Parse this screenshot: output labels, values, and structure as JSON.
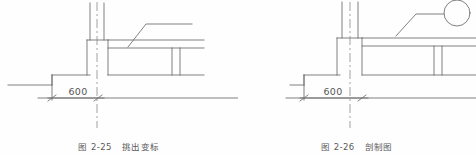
{
  "page": {
    "background_color": "#fefefe",
    "line_color": "#6b6b6b",
    "text_color": "#5a5a5a",
    "width": 476,
    "height": 154
  },
  "figures": [
    {
      "id": "figure-left",
      "caption_number": "图 2-25",
      "caption_title": "挑出变标",
      "dimension_label": "600",
      "detail_bubble": false,
      "elements": [
        "ground-line",
        "step-profile",
        "column",
        "column-centerline",
        "beam",
        "beam-rib",
        "leader-line",
        "dimension-line"
      ]
    },
    {
      "id": "figure-right",
      "caption_number": "图 2-26",
      "caption_title": "剖制图",
      "dimension_label": "600",
      "detail_bubble": true,
      "elements": [
        "ground-line",
        "step-profile",
        "column",
        "column-centerline",
        "beam",
        "beam-rib",
        "leader-line",
        "detail-bubble-circle",
        "dimension-line"
      ]
    }
  ]
}
